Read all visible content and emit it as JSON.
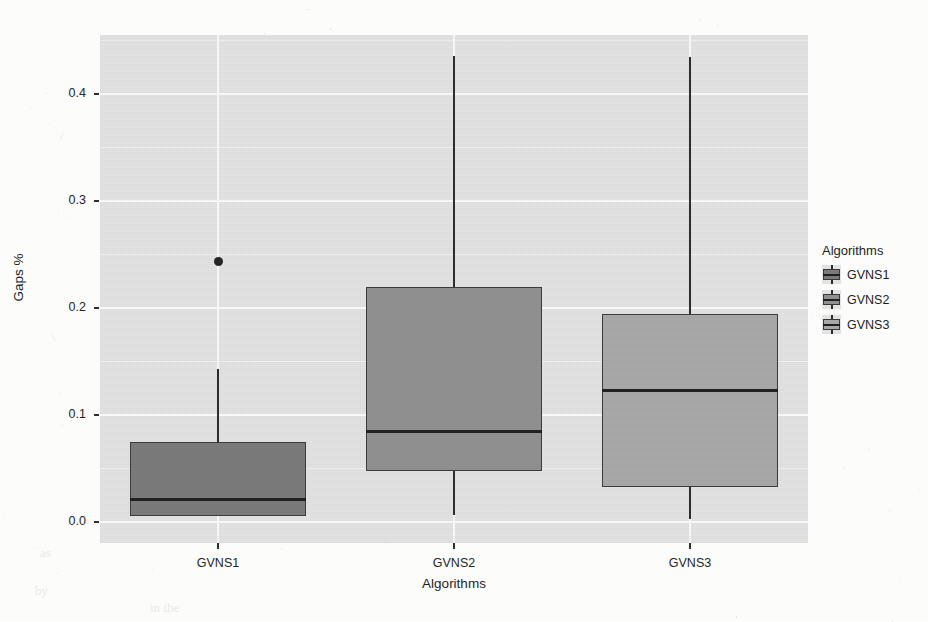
{
  "chart_data": {
    "type": "box",
    "title": "",
    "xlabel": "Algorithms",
    "ylabel": "Gaps %",
    "categories": [
      "GVNS1",
      "GVNS2",
      "GVNS3"
    ],
    "ylim": [
      -0.02,
      0.455
    ],
    "y_ticks": [
      0.0,
      0.1,
      0.2,
      0.3,
      0.4
    ],
    "y_tick_labels": [
      "0.0",
      "0.1",
      "0.2",
      "0.3",
      "0.4"
    ],
    "grid": true,
    "legend_position": "right",
    "legend_title": "Algorithms",
    "boxes": [
      {
        "name": "GVNS1",
        "whisker_low": 0.005,
        "q1": 0.005,
        "median": 0.021,
        "q3": 0.074,
        "whisker_high": 0.143,
        "outliers": [
          0.243
        ],
        "fill": "#7a7a7a"
      },
      {
        "name": "GVNS2",
        "whisker_low": 0.006,
        "q1": 0.047,
        "median": 0.084,
        "q3": 0.219,
        "whisker_high": 0.435,
        "outliers": [],
        "fill": "#909090"
      },
      {
        "name": "GVNS3",
        "whisker_low": 0.002,
        "q1": 0.032,
        "median": 0.123,
        "q3": 0.194,
        "whisker_high": 0.434,
        "outliers": [],
        "fill": "#a8a8a8"
      }
    ],
    "legend_entries": [
      {
        "label": "GVNS1",
        "fill": "#7a7a7a"
      },
      {
        "label": "GVNS2",
        "fill": "#909090"
      },
      {
        "label": "GVNS3",
        "fill": "#a8a8a8"
      }
    ],
    "panel_background": "#e3e3e3",
    "gridline_color": "#fbfbfb"
  },
  "scan": {
    "ghost_lines": [
      "Algorithms Evaluation",
      "the computational experiments were performed on a",
      "sets of instances. The first one is the set of known",
      "are the best known solutions for the benchmark",
      "instances. We compare the three GVNS variants",
      "against each other and against the best results",
      "reported in the literature for the same problem.",
      "on the gaps obtained we can observe that the",
      "GVNS3 variant achieves the lowest average gap",
      "median among all the proposed approaches, while",
      "GVNS1 produces the most concentrated results.",
      "To the right, the box plot summarizes the",
      "distribution of the gaps for each of the variants."
    ]
  }
}
